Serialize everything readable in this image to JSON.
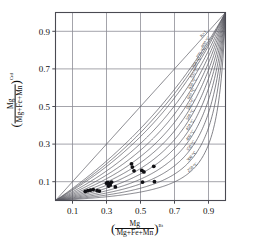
{
  "chart_data": {
    "type": "line",
    "title": "",
    "xlabel": "( Mg / (Mg+Fe+Mn) )^Bt",
    "ylabel": "( Mg / (Mg+Fe+Mn) )^Crd",
    "xlim": [
      0.0,
      1.0
    ],
    "ylim": [
      0.0,
      1.0
    ],
    "grid": true,
    "legend_position": "inline-curve-labels",
    "xticks": [
      "0.1",
      "0.3",
      "0.5",
      "0.7",
      "0.9"
    ],
    "xtick_values": [
      0.1,
      0.3,
      0.5,
      0.7,
      0.9
    ],
    "yticks": [
      "0.1",
      "0.3",
      "0.5",
      "0.7",
      "0.9"
    ],
    "ytick_values": [
      0.1,
      0.3,
      0.5,
      0.7,
      0.9
    ],
    "gridline_values": [
      0.1,
      0.3,
      0.5,
      0.7,
      0.9
    ],
    "axis_numerator": "Mg",
    "axis_denominator": "Mg+Fe+Mn",
    "x_superscript": "Bt",
    "y_superscript": "Crd",
    "curve_family_note": "Fe-Mg exchange isotherms, K = (Mg/Fe)Crd / (Mg/Fe)Bt",
    "series": [
      {
        "name": "K=1",
        "label": "K=1",
        "kd": 1.0
      },
      {
        "name": "800 °C",
        "label": "800 °C",
        "kd": 0.62
      },
      {
        "name": "775 °C",
        "label": "775 °C",
        "kd": 0.565
      },
      {
        "name": "750 °C",
        "label": "750 °C",
        "kd": 0.515
      },
      {
        "name": "700 °C",
        "label": "700 °C",
        "kd": 0.435
      },
      {
        "name": "650 °C",
        "label": "650 °C",
        "kd": 0.365
      },
      {
        "name": "600 °C",
        "label": "600 °C",
        "kd": 0.305
      },
      {
        "name": "550 °C",
        "label": "550 °C",
        "kd": 0.252
      },
      {
        "name": "500 °C",
        "label": "500 °C",
        "kd": 0.205
      },
      {
        "name": "450 °C",
        "label": "450 °C",
        "kd": 0.164
      },
      {
        "name": "400 °C",
        "label": "400 °C",
        "kd": 0.128
      },
      {
        "name": "350 °C",
        "label": "350 °C",
        "kd": 0.097
      },
      {
        "name": "300 °C",
        "label": "300 °C",
        "kd": 0.07
      },
      {
        "name": "250 °C",
        "label": "250 °C",
        "kd": 0.047
      }
    ],
    "points_label": "sample data points",
    "points": [
      {
        "x": 0.175,
        "y": 0.048
      },
      {
        "x": 0.19,
        "y": 0.052
      },
      {
        "x": 0.205,
        "y": 0.055
      },
      {
        "x": 0.222,
        "y": 0.058
      },
      {
        "x": 0.245,
        "y": 0.053
      },
      {
        "x": 0.258,
        "y": 0.05
      },
      {
        "x": 0.3,
        "y": 0.092
      },
      {
        "x": 0.308,
        "y": 0.096
      },
      {
        "x": 0.315,
        "y": 0.09
      },
      {
        "x": 0.322,
        "y": 0.083
      },
      {
        "x": 0.33,
        "y": 0.098
      },
      {
        "x": 0.312,
        "y": 0.077
      },
      {
        "x": 0.447,
        "y": 0.195
      },
      {
        "x": 0.452,
        "y": 0.178
      },
      {
        "x": 0.462,
        "y": 0.158
      },
      {
        "x": 0.508,
        "y": 0.16
      },
      {
        "x": 0.52,
        "y": 0.152
      },
      {
        "x": 0.512,
        "y": 0.098
      },
      {
        "x": 0.578,
        "y": 0.182
      },
      {
        "x": 0.582,
        "y": 0.1
      },
      {
        "x": 0.352,
        "y": 0.072
      }
    ],
    "colors": {
      "curve": "#5a5a62",
      "grid": "#8d8d95",
      "frame": "#4a4a52",
      "point": "#101014",
      "background": "#ffffff"
    }
  }
}
